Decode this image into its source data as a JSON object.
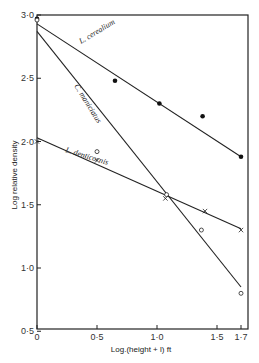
{
  "chart_data": {
    "type": "scatter",
    "title": "",
    "xlabel": "Log.(height + l) ft",
    "ylabel": "Log relative density",
    "xlim": [
      0,
      1.75
    ],
    "ylim": [
      0.5,
      3.0
    ],
    "x_ticks": [
      {
        "value": 0,
        "label": "0"
      },
      {
        "value": 0.5,
        "label": "0·5"
      },
      {
        "value": 1.0,
        "label": "1·0"
      },
      {
        "value": 1.5,
        "label": "1·5"
      },
      {
        "value": 1.7,
        "label": "1·7"
      }
    ],
    "y_ticks": [
      {
        "value": 0.5,
        "label": "0·5"
      },
      {
        "value": 1.0,
        "label": "1·0"
      },
      {
        "value": 1.5,
        "label": "1·5"
      },
      {
        "value": 2.0,
        "label": "2·0"
      },
      {
        "value": 2.5,
        "label": "2·5"
      },
      {
        "value": 3.0,
        "label": "3·0"
      }
    ],
    "grid": false,
    "legend": "inline labels along fitted lines",
    "series": [
      {
        "name": "L. cerealium",
        "marker": "filled-circle",
        "points": [
          [
            0,
            2.97
          ],
          [
            0.65,
            2.48
          ],
          [
            1.02,
            2.3
          ],
          [
            1.38,
            2.2
          ],
          [
            1.7,
            1.88
          ]
        ],
        "fit_line": [
          [
            0,
            2.93
          ],
          [
            1.7,
            1.88
          ]
        ]
      },
      {
        "name": "C. maniciatus",
        "marker": "open-circle",
        "points": [
          [
            0,
            2.96
          ],
          [
            0.5,
            1.92
          ],
          [
            1.08,
            1.58
          ],
          [
            1.37,
            1.3
          ],
          [
            1.7,
            0.8
          ]
        ],
        "fit_line": [
          [
            0,
            2.87
          ],
          [
            1.7,
            0.85
          ]
        ]
      },
      {
        "name": "L. denticornis",
        "marker": "cross",
        "points": [
          [
            0,
            2.0
          ],
          [
            0.5,
            1.85
          ],
          [
            1.07,
            1.55
          ],
          [
            1.4,
            1.45
          ],
          [
            1.7,
            1.3
          ]
        ],
        "fit_line": [
          [
            0,
            2.03
          ],
          [
            1.7,
            1.31
          ]
        ]
      }
    ]
  },
  "labels": {
    "xlabel": "Log.(height + l) ft",
    "ylabel": "Log relative density",
    "series_0": "L. cerealium",
    "series_1": "C. maniciatus",
    "series_2": "L. denticornis"
  }
}
